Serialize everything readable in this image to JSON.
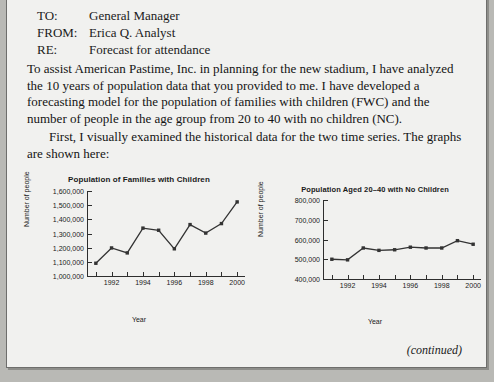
{
  "page": {
    "memo": {
      "rows": [
        {
          "label": "TO:",
          "value": "General Manager"
        },
        {
          "label": "FROM:",
          "value": "Erica Q. Analyst"
        },
        {
          "label": "RE:",
          "value": "Forecast for attendance"
        }
      ]
    },
    "paragraph_1": "To assist American Pastime, Inc. in planning for the new stadium, I have analyzed the 10 years of population data that you provided to me. I have developed a forecasting model for the population of families with children (FWC) and the number of people in the age group from 20 to 40 with no children (NC).",
    "paragraph_2": "First, I visually examined the historical data for the two time series. The graphs are shown here:",
    "footer_note": "(continued)"
  },
  "chart_data": [
    {
      "id": "chart-left",
      "type": "line",
      "title": "Population of Families with Children",
      "xlabel": "Year",
      "ylabel": "Number of people",
      "x": [
        1991,
        1992,
        1993,
        1994,
        1995,
        1996,
        1997,
        1998,
        1999,
        2000
      ],
      "values": [
        1090000,
        1198000,
        1163000,
        1338000,
        1323000,
        1192000,
        1363000,
        1303000,
        1370000,
        1523000
      ],
      "xlim": [
        1990.5,
        2000.5
      ],
      "ylim": [
        1000000,
        1600000
      ],
      "yticks": [
        "1,000,000",
        "1,100,000",
        "1,200,000",
        "1,300,000",
        "1,400,000",
        "1,500,000",
        "1,600,000"
      ],
      "ytick_values": [
        1000000,
        1100000,
        1200000,
        1300000,
        1400000,
        1500000,
        1600000
      ],
      "xticks": [
        "1992",
        "1994",
        "1996",
        "1998",
        "2000"
      ],
      "xtick_values": [
        1992,
        1994,
        1996,
        1998,
        2000
      ],
      "xtick_minor": [
        1991,
        1993,
        1995,
        1997,
        1999
      ],
      "grid": false,
      "legend": "none",
      "marker": "square",
      "color": "#333333"
    },
    {
      "id": "chart-right",
      "type": "line",
      "title": "Population Aged 20–40 with No Children",
      "xlabel": "Year",
      "ylabel": "Number of people",
      "x": [
        1991,
        1992,
        1993,
        1994,
        1995,
        1996,
        1997,
        1998,
        1999,
        2000
      ],
      "values": [
        500000,
        497000,
        557000,
        545000,
        548000,
        561000,
        557000,
        557000,
        594000,
        576000
      ],
      "xlim": [
        1990.5,
        2000.5
      ],
      "ylim": [
        400000,
        800000
      ],
      "yticks": [
        "400,000",
        "500,000",
        "600,000",
        "700,000",
        "800,000"
      ],
      "ytick_values": [
        400000,
        500000,
        600000,
        700000,
        800000
      ],
      "xticks": [
        "1992",
        "1994",
        "1996",
        "1998",
        "2000"
      ],
      "xtick_values": [
        1992,
        1994,
        1996,
        1998,
        2000
      ],
      "xtick_minor": [
        1991,
        1993,
        1995,
        1997,
        1999
      ],
      "grid": false,
      "legend": "none",
      "marker": "square",
      "color": "#333333"
    }
  ]
}
